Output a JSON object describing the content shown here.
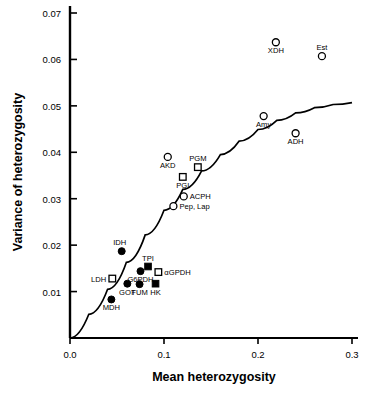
{
  "chart_data": {
    "type": "scatter",
    "title": "",
    "xlabel": "Mean  heterozygosity",
    "ylabel": "Variance  of  heterozygosity",
    "xlim": [
      0.0,
      0.3
    ],
    "ylim": [
      0.0,
      0.072
    ],
    "xticks": [
      "0.0",
      "0.1",
      "0.2",
      "0.3"
    ],
    "xtick_values": [
      0.0,
      0.1,
      0.2,
      0.3
    ],
    "yticks": [
      "0.01",
      "0.02",
      "0.03",
      "0.04",
      "0.05",
      "0.06",
      "0.07"
    ],
    "ytick_values": [
      0.01,
      0.02,
      0.03,
      0.04,
      0.05,
      0.06,
      0.07
    ],
    "grid": false,
    "legend": null,
    "marker_styles": [
      "open-circle",
      "open-square",
      "filled-circle",
      "filled-square"
    ],
    "points": [
      {
        "label": "XDH",
        "x": 0.219,
        "y": 0.0637,
        "marker": "open-circle",
        "label_pos": "below"
      },
      {
        "label": "Est",
        "x": 0.268,
        "y": 0.0607,
        "marker": "open-circle",
        "label_pos": "above"
      },
      {
        "label": "Amy",
        "x": 0.206,
        "y": 0.0478,
        "marker": "open-circle",
        "label_pos": "below"
      },
      {
        "label": "ADH",
        "x": 0.24,
        "y": 0.0441,
        "marker": "open-circle",
        "label_pos": "below"
      },
      {
        "label": "AKD",
        "x": 0.104,
        "y": 0.039,
        "marker": "open-circle",
        "label_pos": "below"
      },
      {
        "label": "PGM",
        "x": 0.136,
        "y": 0.0368,
        "marker": "open-square",
        "label_pos": "above"
      },
      {
        "label": "PGI",
        "x": 0.12,
        "y": 0.0347,
        "marker": "open-square",
        "label_pos": "below"
      },
      {
        "label": "ACPH",
        "x": 0.121,
        "y": 0.0305,
        "marker": "open-circle",
        "label_pos": "right"
      },
      {
        "label": "Pep, Lap",
        "x": 0.11,
        "y": 0.0284,
        "marker": "open-circle",
        "label_pos": "right"
      },
      {
        "label": "IDH",
        "x": 0.055,
        "y": 0.0187,
        "marker": "filled-circle",
        "label_pos": "above-left"
      },
      {
        "label": "TPI",
        "x": 0.083,
        "y": 0.0154,
        "marker": "filled-square",
        "label_pos": "above"
      },
      {
        "label": "αGPDH",
        "x": 0.094,
        "y": 0.0142,
        "marker": "open-square",
        "label_pos": "right"
      },
      {
        "label": "G6PDH",
        "x": 0.075,
        "y": 0.0144,
        "marker": "filled-circle",
        "label_pos": "below"
      },
      {
        "label": "LDH",
        "x": 0.045,
        "y": 0.0128,
        "marker": "open-square",
        "label_pos": "left"
      },
      {
        "label": "GOT",
        "x": 0.061,
        "y": 0.0117,
        "marker": "filled-circle",
        "label_pos": "below"
      },
      {
        "label": "FUM",
        "x": 0.074,
        "y": 0.0116,
        "marker": "filled-circle",
        "label_pos": "below"
      },
      {
        "label": "HK",
        "x": 0.091,
        "y": 0.0117,
        "marker": "filled-square",
        "label_pos": "below"
      },
      {
        "label": "MDH",
        "x": 0.044,
        "y": 0.0083,
        "marker": "filled-circle",
        "label_pos": "below"
      }
    ],
    "curve": {
      "description": "fitted theoretical neutral expectation curve",
      "points": [
        {
          "x": 0.0,
          "y": 0.0
        },
        {
          "x": 0.02,
          "y": 0.0051
        },
        {
          "x": 0.04,
          "y": 0.0105
        },
        {
          "x": 0.06,
          "y": 0.0163
        },
        {
          "x": 0.08,
          "y": 0.0222
        },
        {
          "x": 0.1,
          "y": 0.0275
        },
        {
          "x": 0.12,
          "y": 0.032
        },
        {
          "x": 0.14,
          "y": 0.036
        },
        {
          "x": 0.16,
          "y": 0.0395
        },
        {
          "x": 0.18,
          "y": 0.0424
        },
        {
          "x": 0.2,
          "y": 0.0449
        },
        {
          "x": 0.22,
          "y": 0.0469
        },
        {
          "x": 0.24,
          "y": 0.0485
        },
        {
          "x": 0.26,
          "y": 0.0496
        },
        {
          "x": 0.28,
          "y": 0.0503
        },
        {
          "x": 0.3,
          "y": 0.0507
        }
      ]
    }
  }
}
